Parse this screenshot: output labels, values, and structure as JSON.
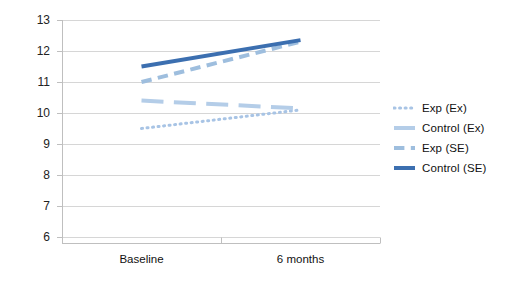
{
  "chart_data": {
    "type": "line",
    "title": "",
    "xlabel": "",
    "ylabel": "",
    "categories": [
      "Baseline",
      "6 months"
    ],
    "ylim": [
      6,
      13
    ],
    "yticks": [
      6,
      7,
      8,
      9,
      10,
      11,
      12,
      13
    ],
    "ytick_labels": [
      "6",
      "7",
      "8",
      "9",
      "10",
      "11",
      "12",
      "13"
    ],
    "grid": true,
    "legend_position": "right",
    "series": [
      {
        "name": "Exp (Ex)",
        "values": [
          9.5,
          10.1
        ],
        "style": "dotted",
        "color": "#a8c4e5",
        "width": 3
      },
      {
        "name": "Control (Ex)",
        "values": [
          10.4,
          10.15
        ],
        "style": "long-dash",
        "color": "#b4cde8",
        "width": 4
      },
      {
        "name": "Exp (SE)",
        "values": [
          11.0,
          12.3
        ],
        "style": "dashed",
        "color": "#9ebede",
        "width": 4
      },
      {
        "name": "Control (SE)",
        "values": [
          11.5,
          12.35
        ],
        "style": "solid",
        "color": "#3c6fb0",
        "width": 4
      }
    ]
  },
  "axis": {
    "y_ticks": [
      "13",
      "12",
      "11",
      "10",
      "9",
      "8",
      "7",
      "6"
    ],
    "x_categories": [
      "Baseline",
      "6 months"
    ]
  },
  "legend": {
    "items": [
      {
        "label": "Exp (Ex)"
      },
      {
        "label": "Control (Ex)"
      },
      {
        "label": "Exp (SE)"
      },
      {
        "label": "Control (SE)"
      }
    ]
  },
  "colors": {
    "series_exp_ex": "#a8c4e5",
    "series_control_ex": "#b4cde8",
    "series_exp_se": "#9ebede",
    "series_control_se": "#3c6fb0",
    "gridline": "#d6d6d6",
    "axis": "#bfbfbf",
    "text": "#111111",
    "background": "#ffffff"
  }
}
